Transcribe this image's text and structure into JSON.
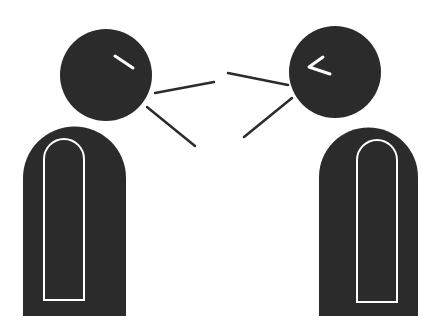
{
  "illustration": {
    "subject": "two-figures-talking",
    "colors": {
      "background": "#ffffff",
      "figure": "#2b2b2b",
      "outline": "#ffffff",
      "line": "#2b2b2b"
    },
    "left_figure": {
      "head": {
        "cx": 106,
        "cy": 75,
        "r": 46
      },
      "eye": {
        "x1": 115,
        "y1": 56,
        "x2": 133,
        "y2": 68
      },
      "body": {
        "x": 23,
        "y": 127,
        "w": 103,
        "h": 189
      },
      "inner_outline": {
        "x": 44,
        "y": 139,
        "w": 40,
        "h": 161
      }
    },
    "right_figure": {
      "head": {
        "cx": 335,
        "cy": 72,
        "r": 46
      },
      "eye": {
        "points": "323,57 309,67 330,74"
      },
      "body": {
        "x": 319,
        "y": 127,
        "w": 99,
        "h": 189
      },
      "inner_outline": {
        "x": 357,
        "y": 140,
        "w": 40,
        "h": 162
      }
    },
    "speech_lines": [
      {
        "x1": 155,
        "y1": 93,
        "x2": 214,
        "y2": 82
      },
      {
        "x1": 147,
        "y1": 107,
        "x2": 195,
        "y2": 146
      },
      {
        "x1": 228,
        "y1": 73,
        "x2": 288,
        "y2": 85
      },
      {
        "x1": 292,
        "y1": 98,
        "x2": 244,
        "y2": 137
      }
    ]
  }
}
